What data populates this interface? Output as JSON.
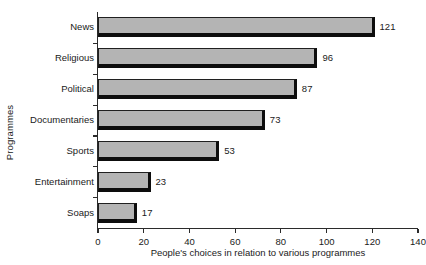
{
  "chart_data": {
    "type": "bar",
    "orientation": "horizontal",
    "title": "",
    "xlabel": "People's choices in relation to various programmes",
    "ylabel": "Programmes",
    "categories": [
      "News",
      "Religious",
      "Political",
      "Documentaries",
      "Sports",
      "Entertainment",
      "Soaps"
    ],
    "values": [
      121,
      96,
      87,
      73,
      53,
      23,
      17
    ],
    "value_labels": [
      "121",
      "96",
      "87",
      "73",
      "53",
      "23",
      "17"
    ],
    "xlim": [
      0,
      140
    ],
    "xticks": [
      0,
      20,
      40,
      60,
      80,
      100,
      120,
      140
    ],
    "xtick_labels": [
      "0",
      "20",
      "40",
      "60",
      "80",
      "100",
      "120",
      "140"
    ],
    "grid": false,
    "legend": null,
    "bar_fill_color": "#b4b4b4",
    "bar_edge_color": "#0d0d0d",
    "axis_color": "#2b2b2b",
    "background_color": "#ffffff"
  }
}
